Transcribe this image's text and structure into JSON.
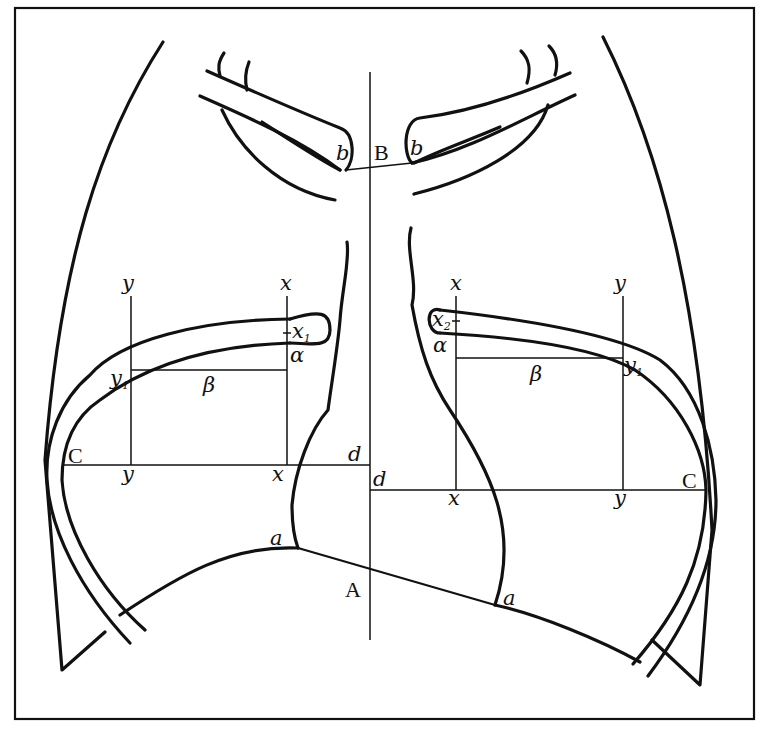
{
  "figure": {
    "labels": {
      "B": "B",
      "A": "A",
      "C_left": "C",
      "C_right": "C",
      "b_left": "b",
      "b_right": "b",
      "a_left": "a",
      "a_right": "a",
      "d_left": "d",
      "d_right": "d",
      "x_left_top": "x",
      "x_left_bottom": "x",
      "x_right_top": "x",
      "x_right_bottom": "x",
      "y_left_top": "y",
      "y_left_bottom": "y",
      "y_right_top": "y",
      "y_right_bottom": "y",
      "x1_base": "x",
      "x1_sub": "1",
      "x2_base": "x",
      "x2_sub": "2",
      "y1_left_base": "y",
      "y1_left_sub": "1",
      "y1_right_base": "y",
      "y1_right_sub": "1",
      "alpha_left": "α",
      "alpha_right": "α",
      "beta_left": "β",
      "beta_right": "β"
    },
    "colors": {
      "ink": "#111111",
      "paper": "#ffffff"
    }
  }
}
